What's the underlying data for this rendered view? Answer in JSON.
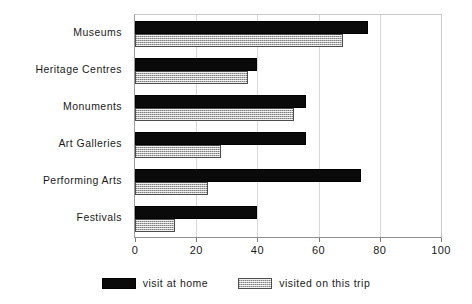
{
  "chart_data": {
    "type": "bar",
    "orientation": "horizontal",
    "title": "",
    "xlabel": "",
    "ylabel": "",
    "xlim": [
      0,
      100
    ],
    "xticks": [
      0,
      20,
      40,
      60,
      80,
      100
    ],
    "grid": true,
    "legend_position": "bottom-center",
    "categories": [
      "Museums",
      "Heritage Centres",
      "Monuments",
      "Art Galleries",
      "Performing Arts",
      "Festivals"
    ],
    "series": [
      {
        "name": "visit at home",
        "color": "#0a0a0a",
        "pattern": "solid",
        "values": [
          76,
          40,
          56,
          56,
          74,
          40
        ]
      },
      {
        "name": "visited on this trip",
        "color": "#b4b4b4",
        "pattern": "checker-hatch",
        "values": [
          68,
          37,
          52,
          28,
          24,
          13
        ]
      }
    ]
  },
  "legend": {
    "items": [
      {
        "label": "visit at home",
        "swatch": "solid-black-swatch"
      },
      {
        "label": "visited on this trip",
        "swatch": "hatched-gray-swatch"
      }
    ]
  }
}
